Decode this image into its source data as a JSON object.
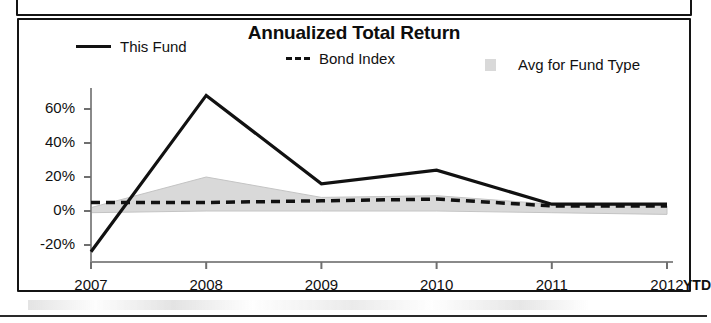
{
  "chart_data": {
    "type": "line",
    "title": "Annualized Total Return",
    "xlabel": "",
    "ylabel": "",
    "x": [
      "2007",
      "2008",
      "2009",
      "2010",
      "2011",
      "2012"
    ],
    "x_suffix_label": "YTD",
    "ylim": [
      -30,
      70
    ],
    "yticks": [
      -20,
      0,
      20,
      40,
      60
    ],
    "ytick_labels": [
      "-20%",
      "0%",
      "20%",
      "40%",
      "60%"
    ],
    "grid": false,
    "legend_position": "top",
    "series": [
      {
        "name": "This Fund",
        "style": "solid",
        "color": "#111111",
        "values": [
          -24,
          68,
          16,
          24,
          4,
          4
        ]
      },
      {
        "name": "Bond Index",
        "style": "dashed",
        "color": "#111111",
        "values": [
          5,
          5,
          6,
          7,
          3,
          3
        ]
      },
      {
        "name": "Avg for Fund Type",
        "style": "area",
        "color": "#d9d9d9",
        "upper": [
          2,
          20,
          8,
          9,
          4,
          3
        ],
        "lower": [
          -1,
          0,
          0,
          0,
          -1,
          -2
        ]
      }
    ]
  },
  "chart": {
    "title": "Annualized Total Return",
    "legend": [
      {
        "label": "This Fund",
        "swatch": "solid-line-swatch"
      },
      {
        "label": "Bond Index",
        "swatch": "dashed-line-swatch"
      },
      {
        "label": "Avg for Fund Type",
        "swatch": "area-fill-swatch"
      }
    ],
    "y_axis": {
      "labels": [
        "60%",
        "40%",
        "20%",
        "0%",
        "-20%"
      ]
    },
    "x_axis": {
      "labels": [
        "2007",
        "2008",
        "2009",
        "2010",
        "2011",
        "2012"
      ],
      "suffix": "YTD"
    }
  }
}
